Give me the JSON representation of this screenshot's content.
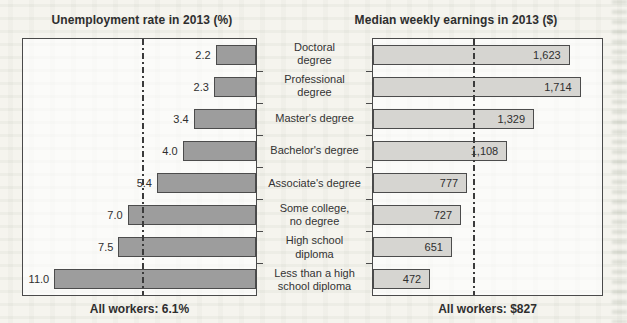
{
  "page": {
    "background_color": "#f5f4ee",
    "text_color": "#333333"
  },
  "chart_data": {
    "type": "bar",
    "layout": "paired-horizontal-pyramid",
    "grid": "off",
    "categories": [
      "Doctoral degree",
      "Professional degree",
      "Master's degree",
      "Bachelor's degree",
      "Associate's degree",
      "Some college, no degree",
      "High school diploma",
      "Less than a high school diploma"
    ],
    "categories_display": [
      "Doctoral\ndegree",
      "Professional\ndegree",
      "Master's degree",
      "Bachelor's degree",
      "Associate's degree",
      "Some college,\nno degree",
      "High school\ndiploma",
      "Less than a high\nschool diploma"
    ],
    "series": [
      {
        "name": "Unemployment rate in 2013 (%)",
        "values": [
          2.2,
          2.3,
          3.4,
          4.0,
          5.4,
          7.0,
          7.5,
          11.0
        ],
        "values_display": [
          "2.2",
          "2.3",
          "3.4",
          "4.0",
          "5.4",
          "7.0",
          "7.5",
          "11.0"
        ],
        "average": 6.1,
        "average_label": "All workers: 6.1%",
        "axis_max": 12.7,
        "direction": "right-to-left",
        "value_label_position": "outside-left",
        "bar_fill": "#9d9d9d",
        "bar_border": "#4c4c4c",
        "average_line_style": "vertical dash-dot",
        "average_line_color": "#3b3b3b"
      },
      {
        "name": "Median weekly earnings in 2013 ($)",
        "values": [
          1623,
          1714,
          1329,
          1108,
          777,
          727,
          651,
          472
        ],
        "values_display": [
          "1,623",
          "1,714",
          "1,329",
          "1,108",
          "777",
          "727",
          "651",
          "472"
        ],
        "average": 827,
        "average_label": "All workers: $827",
        "axis_max": 1890,
        "direction": "left-to-right",
        "value_label_position": "inside-right",
        "bar_fill": "#d6d5d1",
        "bar_border": "#4c4c4c",
        "average_line_style": "vertical dash-dot",
        "average_line_color": "#3b3b3b"
      }
    ]
  }
}
